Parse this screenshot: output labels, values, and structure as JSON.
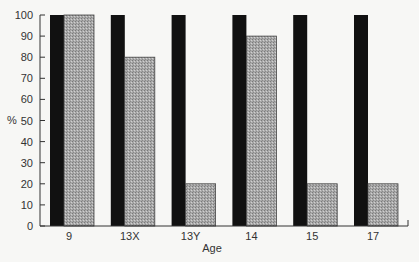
{
  "chart_data": {
    "type": "bar",
    "title": "",
    "xlabel": "Age",
    "ylabel": "%",
    "ylim": [
      0,
      100
    ],
    "yticks": [
      0,
      10,
      20,
      30,
      40,
      50,
      60,
      70,
      80,
      90,
      100
    ],
    "categories": [
      "9",
      "13X",
      "13Y",
      "14",
      "15",
      "17"
    ],
    "series": [
      {
        "name": "series-black",
        "color": "#111111",
        "values": [
          100,
          100,
          100,
          100,
          100,
          100
        ]
      },
      {
        "name": "series-gray",
        "color": "#a8a8a8",
        "pattern": "stipple",
        "values": [
          100,
          80,
          20,
          90,
          20,
          20
        ]
      }
    ],
    "grid": false,
    "legend": null
  }
}
